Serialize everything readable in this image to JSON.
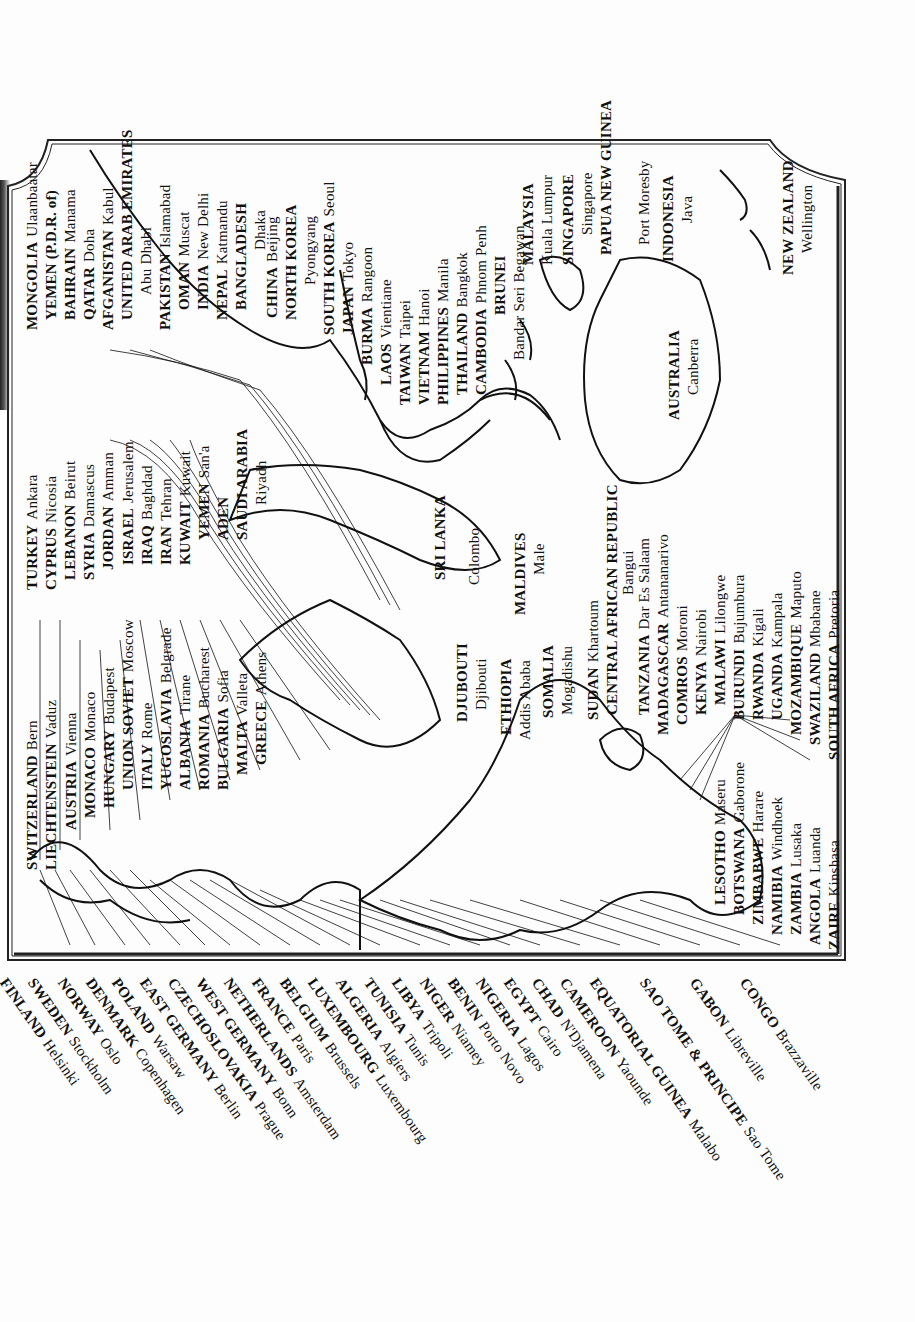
{
  "map": {
    "orientation": "rotated 90° counter-clockwise",
    "subject": "Countries and capital cities of Europe, Africa, Middle East, Asia and Oceania",
    "colors": {
      "ink": "#111111",
      "paper": "#fdfdfd",
      "frame": "#222222"
    }
  },
  "labels_top_row": [
    {
      "country": "SWITZERLAND",
      "capital": "Bern"
    },
    {
      "country": "LIECHTENSTEIN",
      "capital": "Vaduz"
    },
    {
      "country": "AUSTRIA",
      "capital": "Vienna"
    },
    {
      "country": "MONACO",
      "capital": "Monaco"
    },
    {
      "country": "HUNGARY",
      "capital": "Budapest"
    },
    {
      "country": "UNION SOVIET",
      "capital": "Moscow"
    },
    {
      "country": "ITALY",
      "capital": "Rome"
    },
    {
      "country": "YUGOSLAVIA",
      "capital": "Belgrade"
    },
    {
      "country": "ALBANIA",
      "capital": "Tirane"
    },
    {
      "country": "ROMANIA",
      "capital": "Bucharest"
    },
    {
      "country": "BULGARIA",
      "capital": "Sofia"
    },
    {
      "country": "MALTA",
      "capital": "Valleta"
    },
    {
      "country": "GREECE",
      "capital": "Athens"
    }
  ],
  "labels_middle_east": [
    {
      "country": "TURKEY",
      "capital": "Ankara"
    },
    {
      "country": "CYPRUS",
      "capital": "Nicosia"
    },
    {
      "country": "LEBANON",
      "capital": "Beirut"
    },
    {
      "country": "SYRIA",
      "capital": "Damascus"
    },
    {
      "country": "JORDAN",
      "capital": "Amman"
    },
    {
      "country": "ISRAEL",
      "capital": "Jerusalem"
    },
    {
      "country": "IRAQ",
      "capital": "Baghdad"
    },
    {
      "country": "IRAN",
      "capital": "Tehran"
    },
    {
      "country": "KUWAIT",
      "capital": "Kuwait"
    },
    {
      "country": "YEMEN",
      "capital": "San'a"
    },
    {
      "country": "ADEN",
      "capital": ""
    },
    {
      "country": "SAUDI ARABIA",
      "capital": "Riyadh"
    }
  ],
  "labels_asia_west": [
    {
      "country": "MONGOLIA",
      "capital": "Ulaanbaatar"
    },
    {
      "country": "YEMEN (P.D.R. of)",
      "capital": ""
    },
    {
      "country": "BAHRAIN",
      "capital": "Manama"
    },
    {
      "country": "QATAR",
      "capital": "Doha"
    },
    {
      "country": "AFGANISTAN",
      "capital": "Kabul"
    },
    {
      "country": "UNITED ARAB EMIRATES",
      "capital": "Abu Dhabi"
    },
    {
      "country": "PAKISTAN",
      "capital": "Islamabad"
    },
    {
      "country": "OMAN",
      "capital": "Muscat"
    },
    {
      "country": "INDIA",
      "capital": "New Delhi"
    },
    {
      "country": "NEPAL",
      "capital": "Katmandu"
    },
    {
      "country": "BANGLADESH",
      "capital": "Dhaka"
    }
  ],
  "labels_asia_east": [
    {
      "country": "CHINA",
      "capital": "Beijing"
    },
    {
      "country": "NORTH KOREA",
      "capital": "Pyongyang"
    },
    {
      "country": "SOUTH KOREA",
      "capital": "Seoul"
    },
    {
      "country": "JAPAN",
      "capital": "Tokyo"
    },
    {
      "country": "BURMA",
      "capital": "Rangoon"
    },
    {
      "country": "LAOS",
      "capital": "Vientiane"
    },
    {
      "country": "TAIWAN",
      "capital": "Taipei"
    },
    {
      "country": "VIETNAM",
      "capital": "Hanoi"
    },
    {
      "country": "PHILIPPINES",
      "capital": "Manila"
    },
    {
      "country": "THAILAND",
      "capital": "Bangkok"
    },
    {
      "country": "CAMBODIA",
      "capital": "Phnom Penh"
    },
    {
      "country": "BRUNEI",
      "capital": "Bandar Seri Begawan"
    },
    {
      "country": "MALAYSIA",
      "capital": "Kuala Lumpur"
    },
    {
      "country": "SINGAPORE",
      "capital": "Singapore"
    },
    {
      "country": "PAPUA NEW GUINEA",
      "capital": "Port Moresby"
    },
    {
      "country": "INDONESIA",
      "capital": "Java"
    },
    {
      "country": "NEW ZEALAND",
      "capital": "Wellington"
    }
  ],
  "labels_oceania_south_asia": [
    {
      "country": "AUSTRALIA",
      "capital": "Canberra"
    },
    {
      "country": "SRI LANKA",
      "capital": "Colombo"
    },
    {
      "country": "MALDIVES",
      "capital": "Male"
    }
  ],
  "labels_east_africa": [
    {
      "country": "DJUBOUTI",
      "capital": "Djibouti"
    },
    {
      "country": "ETHIOPIA",
      "capital": "Addis Ababa"
    },
    {
      "country": "SOMALIA",
      "capital": "Mogadishu"
    },
    {
      "country": "SUDAN",
      "capital": "Khartoum"
    },
    {
      "country": "CENTRAL AFRICAN REPUBLIC",
      "capital": "Bangui"
    },
    {
      "country": "TANZANIA",
      "capital": "Dar Es Salaam"
    },
    {
      "country": "MADAGASCAR",
      "capital": "Antananarivo"
    },
    {
      "country": "COMROS",
      "capital": "Moroni"
    },
    {
      "country": "KENYA",
      "capital": "Nairobi"
    },
    {
      "country": "MALAWI",
      "capital": "Lilongwe"
    },
    {
      "country": "BURUNDI",
      "capital": "Bujumbura"
    },
    {
      "country": "RWANDA",
      "capital": "Kigali"
    },
    {
      "country": "UGANDA",
      "capital": "Kampala"
    },
    {
      "country": "MOZAMBIQUE",
      "capital": "Maputo"
    },
    {
      "country": "SWAZILAND",
      "capital": "Mbabane"
    },
    {
      "country": "SOUTH AFRICA",
      "capital": "Pretoria"
    }
  ],
  "labels_southern_africa": [
    {
      "country": "LESOTHO",
      "capital": "Maseru"
    },
    {
      "country": "BOTSWANA",
      "capital": "Gaborone"
    },
    {
      "country": "ZIMBABWE",
      "capital": "Harare"
    },
    {
      "country": "NAMIBIA",
      "capital": "Windhoek"
    },
    {
      "country": "ZAMBIA",
      "capital": "Lusaka"
    },
    {
      "country": "ANGOLA",
      "capital": "Luanda"
    },
    {
      "country": "ZAIRE",
      "capital": "Kinshasa"
    }
  ],
  "labels_bottom_outside": [
    {
      "country": "FINLAND",
      "capital": "Helsinki"
    },
    {
      "country": "SWEDEN",
      "capital": "Stockholm"
    },
    {
      "country": "NORWAY",
      "capital": "Oslo"
    },
    {
      "country": "DENMARK",
      "capital": "Copenhagen"
    },
    {
      "country": "POLAND",
      "capital": "Warsaw"
    },
    {
      "country": "EAST GERMANY",
      "capital": "Berlin"
    },
    {
      "country": "CZECHOSLOVAKIA",
      "capital": "Prague"
    },
    {
      "country": "WEST GERMANY",
      "capital": "Bonn"
    },
    {
      "country": "NETHERLANDS",
      "capital": "Amsterdam"
    },
    {
      "country": "FRANCE",
      "capital": "Paris"
    },
    {
      "country": "BELGIUM",
      "capital": "Brussels"
    },
    {
      "country": "LUXEMBOURG",
      "capital": "Luxembourg"
    },
    {
      "country": "ALGERIA",
      "capital": "Algiers"
    },
    {
      "country": "TUNISIA",
      "capital": "Tunis"
    },
    {
      "country": "LIBYA",
      "capital": "Tripoli"
    },
    {
      "country": "NIGER",
      "capital": "Niamey"
    },
    {
      "country": "BENIN",
      "capital": "Porto Novo"
    },
    {
      "country": "NIGERIA",
      "capital": "Lagos"
    },
    {
      "country": "EGYPT",
      "capital": "Cairo"
    },
    {
      "country": "CHAD",
      "capital": "N'Djamena"
    },
    {
      "country": "CAMEROON",
      "capital": "Yaounde"
    },
    {
      "country": "EQUATORIAL GUINEA",
      "capital": "Malabo"
    },
    {
      "country": "SAO TOME & PRINCIPE",
      "capital": "Sao Tome"
    },
    {
      "country": "GABON",
      "capital": "Libreville"
    },
    {
      "country": "CONGO",
      "capital": "Brazzaville"
    }
  ]
}
